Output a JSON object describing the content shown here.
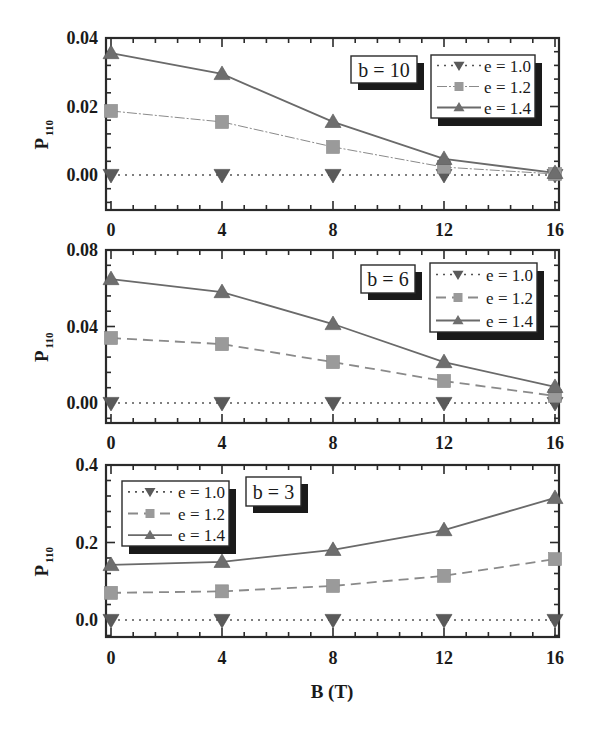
{
  "chart_data": {
    "type": "line",
    "xlabel": "B (T)",
    "x": [
      0,
      4,
      8,
      12,
      16
    ],
    "x_ticks": [
      "0",
      "4",
      "8",
      "12",
      "16"
    ],
    "xlim": [
      0,
      16
    ],
    "legend_entries": [
      "e = 1.0",
      "e = 1.2",
      "e = 1.4"
    ],
    "colors": {
      "markers": "#6e6e6e",
      "e10_marker": "#5a5a5a",
      "e12_marker": "#9a9a9a",
      "line": "#6a6a6a",
      "frame": "#2a2a2a",
      "shadow": "#1a1a1a"
    },
    "panels": [
      {
        "panel_label": "b = 10",
        "ylabel_main": "P",
        "ylabel_sub": "110",
        "ylim": [
          -0.01,
          0.04
        ],
        "y_ticks": [
          0.0,
          0.02,
          0.04
        ],
        "y_tick_labels": [
          "0.00",
          "0.02",
          "0.04"
        ],
        "legend_placement": "top-right",
        "label_placement": "top-center-right",
        "series": [
          {
            "name": "e = 1.0",
            "style": "dotted",
            "marker": "triangle-down",
            "values": [
              0.0,
              0.0,
              0.0,
              0.0,
              0.0
            ]
          },
          {
            "name": "e = 1.2",
            "style": "dash-dot-thin",
            "marker": "square",
            "values": [
              0.0187,
              0.0155,
              0.0082,
              0.0023,
              0.0003
            ]
          },
          {
            "name": "e = 1.4",
            "style": "solid",
            "marker": "triangle-up",
            "values": [
              0.0356,
              0.0295,
              0.0155,
              0.0047,
              0.0006
            ]
          }
        ]
      },
      {
        "panel_label": "b = 6",
        "ylabel_main": "P",
        "ylabel_sub": "110",
        "ylim": [
          -0.0105,
          0.08
        ],
        "y_ticks": [
          0.0,
          0.04,
          0.08
        ],
        "y_tick_labels": [
          "0.00",
          "0.04",
          "0.08"
        ],
        "legend_placement": "top-right",
        "label_placement": "top-center-right",
        "series": [
          {
            "name": "e = 1.0",
            "style": "dotted",
            "marker": "triangle-down",
            "values": [
              0.0,
              0.0,
              0.0,
              0.0,
              0.0
            ]
          },
          {
            "name": "e = 1.2",
            "style": "dashed",
            "marker": "square",
            "values": [
              0.034,
              0.0308,
              0.0214,
              0.0115,
              0.0037
            ]
          },
          {
            "name": "e = 1.4",
            "style": "solid",
            "marker": "triangle-up",
            "values": [
              0.0648,
              0.058,
              0.0413,
              0.0214,
              0.0084
            ]
          }
        ]
      },
      {
        "panel_label": "b = 3",
        "ylabel_main": "P",
        "ylabel_sub": "110",
        "ylim": [
          -0.044,
          0.4
        ],
        "y_ticks": [
          0.0,
          0.2,
          0.4
        ],
        "y_tick_labels": [
          "0.0",
          "0.2",
          "0.4"
        ],
        "legend_placement": "top-left",
        "label_placement": "top-center",
        "series": [
          {
            "name": "e = 1.0",
            "style": "dotted",
            "marker": "triangle-down",
            "values": [
              0.0,
              0.0,
              0.0,
              0.0,
              0.0
            ]
          },
          {
            "name": "e = 1.2",
            "style": "dashed",
            "marker": "square",
            "values": [
              0.07,
              0.074,
              0.088,
              0.114,
              0.157
            ]
          },
          {
            "name": "e = 1.4",
            "style": "solid",
            "marker": "triangle-up",
            "values": [
              0.142,
              0.15,
              0.181,
              0.232,
              0.315
            ]
          }
        ]
      }
    ]
  }
}
